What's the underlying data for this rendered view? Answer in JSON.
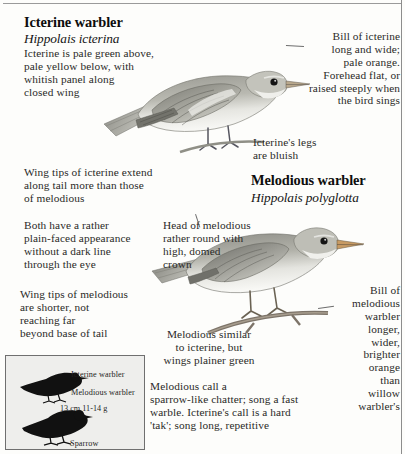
{
  "page": {
    "kind": "field-guide-plate",
    "background_color": "#fdfdfb",
    "text_color": "#2a2a28"
  },
  "species": [
    {
      "id": "icterine",
      "common_name": "Icterine warbler",
      "scientific_name": "Hippolais icterina"
    },
    {
      "id": "melodious",
      "common_name": "Melodious warbler",
      "scientific_name": "Hippolais polyglotta"
    }
  ],
  "annotations": {
    "icterine_plumage": "Icterine is pale green above,\npale yellow below, with\nwhitish panel along\nclosed wing",
    "icterine_bill": "Bill of icterine\nlong and wide;\npale orange.\nForehead flat, or\nraised steeply when\nthe bird sings",
    "icterine_legs": "Icterine's legs\nare bluish",
    "icterine_wingtips": "Wing tips of icterine extend\nalong tail more than those\nof melodious",
    "plain_faced": "Both have a rather\nplain-faced appearance\nwithout a dark line\nthrough the eye",
    "melodious_head": "Head of melodious\nrather round with\nhigh, domed\ncrown",
    "melodious_wingtips": "Wing tips of melodious\nare shorter, not\nreaching far\nbeyond base of tail",
    "melodious_similar": "Melodious similar\nto icterine, but\nwings plainer green",
    "melodious_bill": "Bill of\nmelodious\nwarbler\nlonger,\nwider,\nbrighter\norange\nthan\nwillow\nwarbler's",
    "calls": "Melodious call a\nsparrow-like chatter; song a fast\nwarble. Icterine's call is a hard\n'tak'; song long, repetitive"
  },
  "inset": {
    "label_icterine": "Icterine warbler",
    "label_melodious": "Melodious warbler",
    "size": "13 cm  11-14 g",
    "label_sparrow": "Sparrow"
  }
}
